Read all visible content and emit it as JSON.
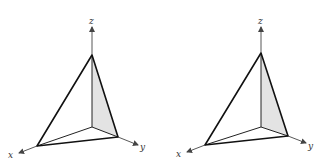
{
  "figure": {
    "panels": [
      {
        "id": "left",
        "axis_labels": {
          "x": "x",
          "y": "y",
          "z": "z"
        },
        "shaded_face": "yz-plane triangle",
        "shade_color": "#e3e3e3"
      },
      {
        "id": "right",
        "axis_labels": {
          "x": "x",
          "y": "y",
          "z": "z"
        },
        "shaded_face": "yz-plane triangle",
        "shade_color": "#e3e3e3"
      }
    ]
  }
}
